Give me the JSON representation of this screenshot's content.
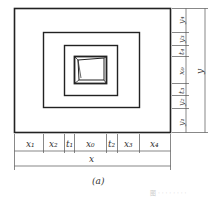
{
  "figure": {
    "caption": "(a)",
    "faint_caption": "图 · · · · · · · ·",
    "horizontal_segments": [
      "x1",
      "x2",
      "t1",
      "x0",
      "t2",
      "x3",
      "x4"
    ],
    "horizontal_total": "x",
    "vertical_segments_top_to_bottom": [
      "y4",
      "y3",
      "t4",
      "x0",
      "t3",
      "y2",
      "y1"
    ],
    "vertical_total": "y",
    "labels": {
      "x1": "x₁",
      "x2": "x₂",
      "t1": "t₁",
      "x0": "x₀",
      "t2": "t₂",
      "x3": "x₃",
      "x4": "x₄",
      "x": "x",
      "y4": "y₄",
      "y3": "y₃",
      "t4": "t₄",
      "vx0": "x₀",
      "t3": "t₃",
      "y2": "y₂",
      "y1": "y₁",
      "y": "y"
    }
  }
}
